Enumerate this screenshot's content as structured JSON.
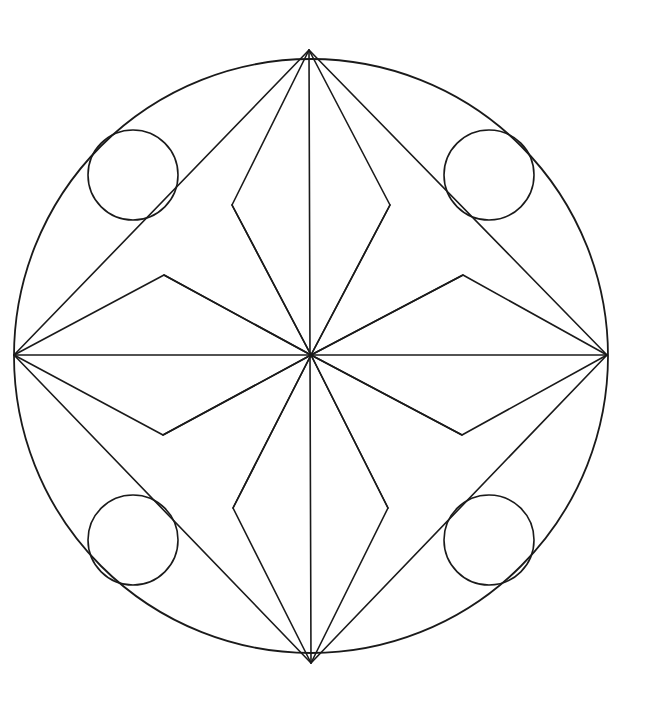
{
  "artwork": {
    "title": "Geometric Mandala Line Drawing",
    "subject": "symmetrical circular mandala coloring page",
    "style": "black line art on white background",
    "canvas": {
      "width": 649,
      "height": 706,
      "background_color": "#ffffff"
    },
    "line_color": "#1a1a1a",
    "fill_color": "none",
    "stroke_width": 1.6,
    "symmetry": "4-fold radial with horizontal and vertical mirror axes"
  },
  "geometry": {
    "center": {
      "x": 311,
      "y": 355
    },
    "outer_circle": {
      "name": "outer-boundary-circle",
      "cx": 311,
      "cy": 356,
      "r": 297,
      "stroke_width": 1.8
    },
    "cardinal_vertices": {
      "top": {
        "x": 309,
        "y": 50
      },
      "right": {
        "x": 607,
        "y": 355
      },
      "bottom": {
        "x": 311,
        "y": 663
      },
      "left": {
        "x": 14,
        "y": 355
      }
    },
    "axis_lines": [
      {
        "name": "vertical-axis",
        "x1": 309,
        "y1": 50,
        "x2": 311,
        "y2": 663
      },
      {
        "name": "horizontal-axis",
        "x1": 14,
        "y1": 355,
        "x2": 607,
        "y2": 355
      }
    ],
    "diagonal_lines": [
      {
        "name": "diagonal-top-left",
        "x1": 309,
        "y1": 50,
        "x2": 14,
        "y2": 355
      },
      {
        "name": "diagonal-top-right",
        "x1": 309,
        "y1": 50,
        "x2": 607,
        "y2": 355
      },
      {
        "name": "diagonal-bottom-left",
        "x1": 311,
        "y1": 663,
        "x2": 14,
        "y2": 355
      },
      {
        "name": "diagonal-bottom-right",
        "x1": 311,
        "y1": 663,
        "x2": 607,
        "y2": 355
      }
    ],
    "spokes_from_center": [
      {
        "name": "spoke-up-left",
        "x1": 311,
        "y1": 355,
        "x2": 232,
        "y2": 205
      },
      {
        "name": "spoke-up-right",
        "x1": 311,
        "y1": 355,
        "x2": 390,
        "y2": 205
      },
      {
        "name": "spoke-left-up",
        "x1": 311,
        "y1": 355,
        "x2": 164,
        "y2": 275
      },
      {
        "name": "spoke-right-up",
        "x1": 311,
        "y1": 355,
        "x2": 463,
        "y2": 275
      },
      {
        "name": "spoke-left-down",
        "x1": 311,
        "y1": 355,
        "x2": 163,
        "y2": 435
      },
      {
        "name": "spoke-right-down",
        "x1": 311,
        "y1": 355,
        "x2": 462,
        "y2": 435
      },
      {
        "name": "spoke-down-left",
        "x1": 311,
        "y1": 355,
        "x2": 233,
        "y2": 508
      },
      {
        "name": "spoke-down-right",
        "x1": 311,
        "y1": 355,
        "x2": 388,
        "y2": 508
      }
    ],
    "diamonds": [
      {
        "name": "upper-diamond",
        "points": "309,50 232,205 311,355 390,205",
        "tip_top": {
          "x": 309,
          "y": 50
        },
        "tip_bottom": {
          "x": 311,
          "y": 355
        },
        "width_px": 158,
        "height_px": 305
      },
      {
        "name": "lower-diamond",
        "points": "311,663 233,508 311,355 388,508",
        "tip_top": {
          "x": 311,
          "y": 355
        },
        "tip_bottom": {
          "x": 311,
          "y": 663
        },
        "width_px": 155,
        "height_px": 308
      }
    ],
    "kites": [
      {
        "name": "left-kite",
        "points": "14,355 164,275 311,355 163,435",
        "tip_outer": {
          "x": 14,
          "y": 355
        },
        "tip_inner": {
          "x": 311,
          "y": 355
        },
        "width_px": 297,
        "height_px": 160
      },
      {
        "name": "right-kite",
        "points": "607,355 463,275 311,355 462,435",
        "tip_outer": {
          "x": 607,
          "y": 355
        },
        "tip_inner": {
          "x": 311,
          "y": 355
        },
        "width_px": 296,
        "height_px": 160
      }
    ],
    "small_circles": [
      {
        "name": "circle-top-left",
        "cx": 133,
        "cy": 175,
        "r": 45
      },
      {
        "name": "circle-top-right",
        "cx": 489,
        "cy": 175,
        "r": 45
      },
      {
        "name": "circle-bottom-left",
        "cx": 133,
        "cy": 540,
        "r": 45
      },
      {
        "name": "circle-bottom-right",
        "cx": 489,
        "cy": 540,
        "r": 45
      }
    ],
    "counts": {
      "outer_circles": 1,
      "small_circles": 4,
      "diamonds": 2,
      "kites": 2,
      "diagonals": 4,
      "axes": 2,
      "center_spokes": 8,
      "total_lines_through_center": 12
    }
  },
  "chart_data": {
    "type": "scatter",
    "xlabel": "",
    "ylabel": "",
    "xlim": [
      0,
      649
    ],
    "ylim": [
      0,
      706
    ],
    "grid": false,
    "legend": "none",
    "categories": [
      "outer-boundary-circle",
      "small-circle-top-left",
      "small-circle-top-right",
      "small-circle-bottom-left",
      "small-circle-bottom-right",
      "upper-diamond",
      "lower-diamond",
      "left-kite",
      "right-kite"
    ],
    "values": [
      297,
      45,
      45,
      45,
      45,
      305,
      308,
      297,
      296
    ],
    "annotations": [
      "Center point at (311, 355) where 12 lines converge",
      "Four cardinal vertices on the outer circle at top, right, bottom, left",
      "Four small circles placed on the 45-degree diagonals",
      "Two vertical diamonds above and below center",
      "Two horizontal kites left and right of center"
    ]
  }
}
